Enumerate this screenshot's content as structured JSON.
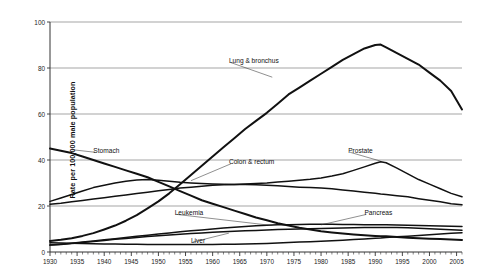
{
  "chart_data": {
    "type": "line",
    "title": "",
    "xlabel": "",
    "ylabel": "Rate per 100,000 male population",
    "xlim": [
      1930,
      2006
    ],
    "ylim": [
      0,
      100
    ],
    "grid": true,
    "legend_position": "inline-annotations",
    "yticks": [
      0,
      20,
      40,
      60,
      80,
      100
    ],
    "xticks": [
      1930,
      1935,
      1940,
      1945,
      1950,
      1955,
      1960,
      1965,
      1970,
      1975,
      1980,
      1985,
      1990,
      1995,
      2000,
      2005
    ],
    "minor_tick_interval": 1,
    "x": [
      1930,
      1932,
      1934,
      1936,
      1938,
      1940,
      1942,
      1944,
      1946,
      1948,
      1950,
      1952,
      1954,
      1956,
      1958,
      1960,
      1962,
      1964,
      1966,
      1968,
      1970,
      1972,
      1974,
      1976,
      1978,
      1980,
      1982,
      1984,
      1986,
      1988,
      1990,
      1991,
      1992,
      1994,
      1996,
      1998,
      2000,
      2002,
      2004,
      2006
    ],
    "series": [
      {
        "name": "Lung & bronchus",
        "values": [
          4.8,
          5.3,
          6.0,
          7.0,
          8.2,
          9.8,
          11.5,
          13.6,
          16.0,
          19.0,
          22.0,
          25.5,
          29.5,
          33.5,
          37.5,
          41.5,
          45.5,
          49.5,
          53.5,
          57.0,
          60.5,
          64.5,
          68.5,
          71.5,
          74.5,
          77.5,
          80.5,
          83.5,
          86.0,
          88.5,
          90.0,
          90.2,
          89.0,
          86.5,
          84.0,
          81.5,
          78.0,
          74.5,
          70.0,
          62.0
        ]
      },
      {
        "name": "Stomach",
        "values": [
          45.0,
          44.0,
          43.0,
          41.5,
          40.0,
          38.5,
          37.0,
          35.5,
          34.0,
          32.5,
          30.5,
          28.5,
          26.5,
          24.5,
          22.5,
          21.0,
          19.5,
          18.0,
          16.5,
          15.0,
          13.8,
          12.5,
          11.5,
          10.5,
          9.8,
          9.0,
          8.5,
          8.0,
          7.6,
          7.3,
          7.0,
          6.9,
          6.8,
          6.5,
          6.2,
          6.0,
          5.8,
          5.6,
          5.4,
          5.2
        ]
      },
      {
        "name": "Colon & rectum",
        "values": [
          22.0,
          23.5,
          25.0,
          26.5,
          28.0,
          29.0,
          30.0,
          30.8,
          31.3,
          31.5,
          31.2,
          30.8,
          30.3,
          30.0,
          29.8,
          29.6,
          29.5,
          29.4,
          29.3,
          29.2,
          29.0,
          28.8,
          28.5,
          28.2,
          28.0,
          27.8,
          27.5,
          27.0,
          26.5,
          26.0,
          25.5,
          25.2,
          25.0,
          24.5,
          24.0,
          23.2,
          22.5,
          21.8,
          21.0,
          20.5
        ]
      },
      {
        "name": "Prostate",
        "values": [
          20.8,
          21.2,
          21.8,
          22.4,
          23.0,
          23.6,
          24.2,
          24.8,
          25.4,
          26.0,
          26.6,
          27.2,
          27.8,
          28.2,
          28.6,
          29.0,
          29.2,
          29.4,
          29.6,
          29.8,
          30.0,
          30.4,
          30.8,
          31.2,
          31.6,
          32.2,
          33.0,
          34.0,
          35.5,
          37.0,
          38.6,
          39.2,
          38.8,
          36.5,
          34.0,
          31.5,
          29.5,
          27.5,
          25.5,
          24.0
        ]
      },
      {
        "name": "Leukemia",
        "values": [
          3.0,
          3.3,
          3.7,
          4.1,
          4.6,
          5.0,
          5.5,
          5.9,
          6.3,
          6.7,
          7.1,
          7.4,
          7.7,
          8.0,
          8.3,
          8.6,
          8.8,
          9.0,
          9.2,
          9.4,
          9.6,
          9.8,
          9.9,
          10.0,
          10.1,
          10.2,
          10.3,
          10.4,
          10.5,
          10.6,
          10.7,
          10.7,
          10.7,
          10.6,
          10.5,
          10.3,
          10.1,
          9.9,
          9.7,
          9.5
        ]
      },
      {
        "name": "Pancreas",
        "values": [
          3.0,
          3.4,
          3.8,
          4.3,
          4.8,
          5.3,
          5.8,
          6.3,
          6.8,
          7.3,
          7.8,
          8.3,
          8.8,
          9.2,
          9.6,
          10.0,
          10.4,
          10.8,
          11.1,
          11.4,
          11.6,
          11.8,
          11.9,
          12.0,
          12.1,
          12.1,
          12.1,
          12.0,
          12.0,
          11.9,
          11.9,
          11.8,
          11.8,
          11.7,
          11.6,
          11.5,
          11.4,
          11.3,
          11.2,
          11.1
        ]
      },
      {
        "name": "Liver",
        "values": [
          4.0,
          3.9,
          3.8,
          3.7,
          3.6,
          3.5,
          3.5,
          3.4,
          3.4,
          3.3,
          3.3,
          3.3,
          3.3,
          3.3,
          3.3,
          3.3,
          3.4,
          3.4,
          3.5,
          3.6,
          3.7,
          3.9,
          4.1,
          4.3,
          4.5,
          4.7,
          4.9,
          5.1,
          5.4,
          5.7,
          6.0,
          6.1,
          6.3,
          6.6,
          6.9,
          7.2,
          7.5,
          7.8,
          8.1,
          8.4
        ]
      }
    ],
    "annotations": [
      {
        "label": "Lung & bronchus",
        "x": 1963,
        "y": 83
      },
      {
        "label": "Stomach",
        "x": 1938,
        "y": 44
      },
      {
        "label": "Colon & rectum",
        "x": 1963,
        "y": 39
      },
      {
        "label": "Prostate",
        "x": 1985,
        "y": 44
      },
      {
        "label": "Leukemia",
        "x": 1953,
        "y": 17
      },
      {
        "label": "Pancreas",
        "x": 1988,
        "y": 17
      },
      {
        "label": "Liver",
        "x": 1956,
        "y": 5
      }
    ]
  },
  "axis": {
    "y_title": "Rate per 100,000 male population",
    "y_tick_labels": [
      "100",
      "80",
      "60",
      "40",
      "20",
      "0"
    ],
    "x_tick_labels": [
      "1930",
      "1935",
      "1940",
      "1945",
      "1950",
      "1955",
      "1960",
      "1965",
      "1970",
      "1975",
      "1980",
      "1985",
      "1990",
      "1995",
      "2000",
      "2005"
    ]
  },
  "colors": {
    "line": "#111111",
    "grid": "#808080",
    "axis": "#333333",
    "text": "#1a1a1a",
    "background": "#ffffff"
  }
}
